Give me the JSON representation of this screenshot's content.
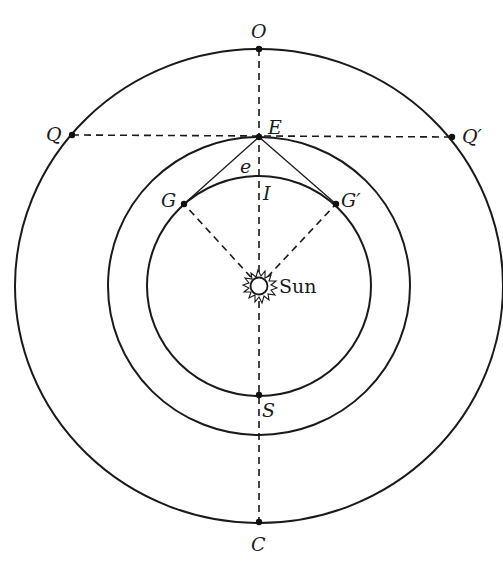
{
  "diagram": {
    "type": "orbital-geometry",
    "center": {
      "x": 259,
      "y": 286
    },
    "orbits": [
      {
        "name": "outer",
        "rx": 244,
        "ry": 237
      },
      {
        "name": "earth",
        "rx": 151,
        "ry": 149
      },
      {
        "name": "inner",
        "rx": 112,
        "ry": 110
      }
    ],
    "points": {
      "O": {
        "label": "O",
        "x": 259,
        "y": 49
      },
      "Q": {
        "label": "Q",
        "x": 72,
        "y": 135
      },
      "Q_prime": {
        "label": "Q′",
        "x": 452,
        "y": 137
      },
      "E": {
        "label": "E",
        "x": 259,
        "y": 137
      },
      "e": {
        "label": "e"
      },
      "I": {
        "label": "I",
        "x": 259,
        "y": 176
      },
      "G": {
        "label": "G",
        "x": 184,
        "y": 204
      },
      "G_prime": {
        "label": "G′",
        "x": 336,
        "y": 204
      },
      "S": {
        "label": "S",
        "x": 259,
        "y": 395
      },
      "C": {
        "label": "C",
        "x": 259,
        "y": 522
      }
    },
    "sun": {
      "label": "Sun",
      "x": 259,
      "y": 286
    },
    "colors": {
      "ink": "#1a1a1a",
      "background": "#ffffff"
    }
  }
}
